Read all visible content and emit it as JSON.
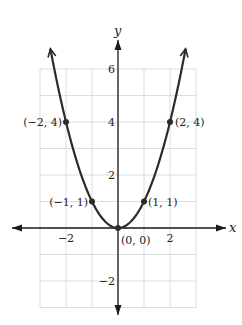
{
  "chart_data": {
    "type": "line",
    "title": "",
    "function": "y = x^2",
    "xlabel": "x",
    "ylabel": "y",
    "xlim": [
      -3,
      3
    ],
    "ylim": [
      -3,
      6
    ],
    "grid": true,
    "x_ticks": [
      {
        "value": -2,
        "label": "−2"
      },
      {
        "value": 2,
        "label": "2"
      }
    ],
    "y_ticks": [
      {
        "value": 6,
        "label": "6"
      },
      {
        "value": 4,
        "label": "4"
      },
      {
        "value": 2,
        "label": "2"
      },
      {
        "value": -2,
        "label": "−2"
      }
    ],
    "curve_x_range": [
      -2.6,
      2.6
    ],
    "points": [
      {
        "x": -2,
        "y": 4,
        "label": "(−2, 4)"
      },
      {
        "x": -1,
        "y": 1,
        "label": "(−1, 1)"
      },
      {
        "x": 0,
        "y": 0,
        "label": "(0, 0)"
      },
      {
        "x": 1,
        "y": 1,
        "label": "(1, 1)"
      },
      {
        "x": 2,
        "y": 4,
        "label": "(2, 4)"
      }
    ],
    "colors": {
      "curve": "#2b2b2b",
      "grid": "#d4d4d4",
      "axis": "#1a1a1a"
    }
  }
}
